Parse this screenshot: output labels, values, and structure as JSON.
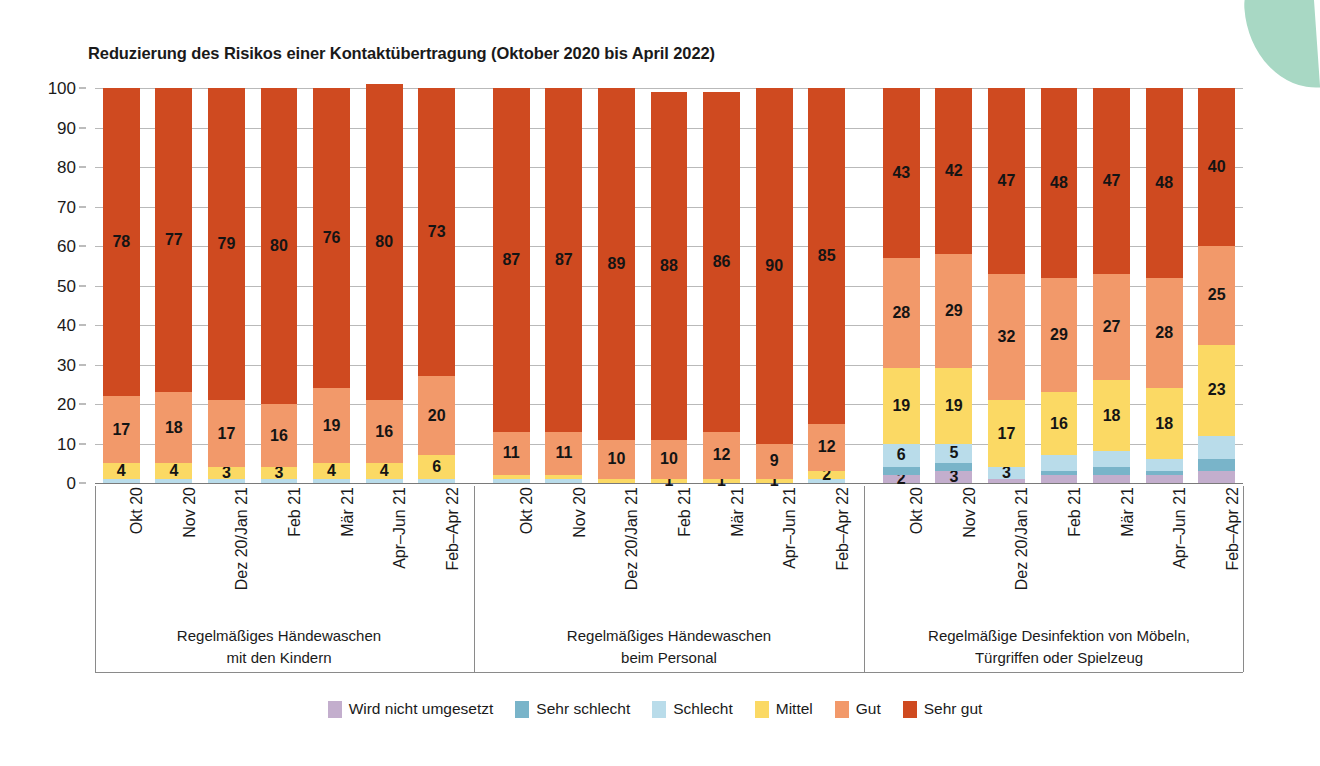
{
  "chart_data": {
    "type": "bar",
    "subtype": "stacked-bar-100-percent",
    "title": "Reduzierung des Risikos einer Kontaktübertragung (Oktober 2020 bis April 2022)",
    "xlabel": "",
    "ylabel": "",
    "ylim": [
      0,
      100
    ],
    "yticks": [
      0,
      10,
      20,
      30,
      40,
      50,
      60,
      70,
      80,
      90,
      100
    ],
    "grid": true,
    "legend_position": "bottom",
    "stack_order_bottom_to_top": [
      "Wird nicht umgesetzt",
      "Sehr schlecht",
      "Schlecht",
      "Mittel",
      "Gut",
      "Sehr gut"
    ],
    "series": [
      {
        "name": "Wird nicht umgesetzt",
        "color": "#c3aecd"
      },
      {
        "name": "Sehr schlecht",
        "color": "#79b4c9"
      },
      {
        "name": "Schlecht",
        "color": "#b9dcea"
      },
      {
        "name": "Mittel",
        "color": "#fbd964"
      },
      {
        "name": "Gut",
        "color": "#f2996a"
      },
      {
        "name": "Sehr gut",
        "color": "#cf4a20"
      }
    ],
    "categories": [
      "Okt 20",
      "Nov 20",
      "Dez 20/Jan 21",
      "Feb 21",
      "Mär 21",
      "Apr–Jun 21",
      "Feb–Apr 22"
    ],
    "groups": [
      {
        "label_line1": "Regelmäßiges Händewaschen",
        "label_line2": "mit den Kindern",
        "bars": [
          {
            "category": "Okt 20",
            "values": {
              "Wird nicht umgesetzt": 0,
              "Sehr schlecht": 0,
              "Schlecht": 1,
              "Mittel": 4,
              "Gut": 17,
              "Sehr gut": 78
            },
            "labels": {
              "Mittel": "4",
              "Gut": "17",
              "Sehr gut": "78"
            }
          },
          {
            "category": "Nov 20",
            "values": {
              "Wird nicht umgesetzt": 0,
              "Sehr schlecht": 0,
              "Schlecht": 1,
              "Mittel": 4,
              "Gut": 18,
              "Sehr gut": 77
            },
            "labels": {
              "Mittel": "4",
              "Gut": "18",
              "Sehr gut": "77"
            }
          },
          {
            "category": "Dez 20/Jan 21",
            "values": {
              "Wird nicht umgesetzt": 0,
              "Sehr schlecht": 0,
              "Schlecht": 1,
              "Mittel": 3,
              "Gut": 17,
              "Sehr gut": 79
            },
            "labels": {
              "Mittel": "3",
              "Gut": "17",
              "Sehr gut": "79"
            }
          },
          {
            "category": "Feb 21",
            "values": {
              "Wird nicht umgesetzt": 0,
              "Sehr schlecht": 0,
              "Schlecht": 1,
              "Mittel": 3,
              "Gut": 16,
              "Sehr gut": 80
            },
            "labels": {
              "Mittel": "3",
              "Gut": "16",
              "Sehr gut": "80"
            }
          },
          {
            "category": "Mär 21",
            "values": {
              "Wird nicht umgesetzt": 0,
              "Sehr schlecht": 0,
              "Schlecht": 1,
              "Mittel": 4,
              "Gut": 19,
              "Sehr gut": 76
            },
            "labels": {
              "Mittel": "4",
              "Gut": "19",
              "Sehr gut": "76"
            }
          },
          {
            "category": "Apr–Jun 21",
            "values": {
              "Wird nicht umgesetzt": 0,
              "Sehr schlecht": 0,
              "Schlecht": 1,
              "Mittel": 4,
              "Gut": 16,
              "Sehr gut": 80
            },
            "labels": {
              "Mittel": "4",
              "Gut": "16",
              "Sehr gut": "80"
            }
          },
          {
            "category": "Feb–Apr 22",
            "values": {
              "Wird nicht umgesetzt": 0,
              "Sehr schlecht": 0,
              "Schlecht": 1,
              "Mittel": 6,
              "Gut": 20,
              "Sehr gut": 73
            },
            "labels": {
              "Mittel": "6",
              "Gut": "20",
              "Sehr gut": "73"
            }
          }
        ]
      },
      {
        "label_line1": "Regelmäßiges Händewaschen",
        "label_line2": "beim Personal",
        "bars": [
          {
            "category": "Okt 20",
            "values": {
              "Wird nicht umgesetzt": 0,
              "Sehr schlecht": 0,
              "Schlecht": 1,
              "Mittel": 1,
              "Gut": 11,
              "Sehr gut": 87
            },
            "labels": {
              "Gut": "11",
              "Sehr gut": "87"
            }
          },
          {
            "category": "Nov 20",
            "values": {
              "Wird nicht umgesetzt": 0,
              "Sehr schlecht": 0,
              "Schlecht": 1,
              "Mittel": 1,
              "Gut": 11,
              "Sehr gut": 87
            },
            "labels": {
              "Gut": "11",
              "Sehr gut": "87"
            }
          },
          {
            "category": "Dez 20/Jan 21",
            "values": {
              "Wird nicht umgesetzt": 0,
              "Sehr schlecht": 0,
              "Schlecht": 0,
              "Mittel": 1,
              "Gut": 10,
              "Sehr gut": 89
            },
            "labels": {
              "Gut": "10",
              "Sehr gut": "89"
            }
          },
          {
            "category": "Feb 21",
            "values": {
              "Wird nicht umgesetzt": 0,
              "Sehr schlecht": 0,
              "Schlecht": 0,
              "Mittel": 1,
              "Gut": 10,
              "Sehr gut": 88
            },
            "labels": {
              "Mittel": "1",
              "Gut": "10",
              "Sehr gut": "88"
            }
          },
          {
            "category": "Mär 21",
            "values": {
              "Wird nicht umgesetzt": 0,
              "Sehr schlecht": 0,
              "Schlecht": 0,
              "Mittel": 1,
              "Gut": 12,
              "Sehr gut": 86
            },
            "labels": {
              "Mittel": "1",
              "Gut": "12",
              "Sehr gut": "86"
            }
          },
          {
            "category": "Apr–Jun 21",
            "values": {
              "Wird nicht umgesetzt": 0,
              "Sehr schlecht": 0,
              "Schlecht": 0,
              "Mittel": 1,
              "Gut": 9,
              "Sehr gut": 90
            },
            "labels": {
              "Mittel": "1",
              "Gut": "9",
              "Sehr gut": "90"
            }
          },
          {
            "category": "Feb–Apr 22",
            "values": {
              "Wird nicht umgesetzt": 0,
              "Sehr schlecht": 0,
              "Schlecht": 1,
              "Mittel": 2,
              "Gut": 12,
              "Sehr gut": 85
            },
            "labels": {
              "Mittel": "2",
              "Gut": "12",
              "Sehr gut": "85"
            }
          }
        ]
      },
      {
        "label_line1": "Regelmäßige Desinfektion von Möbeln,",
        "label_line2": "Türgriffen oder Spielzeug",
        "bars": [
          {
            "category": "Okt 20",
            "values": {
              "Wird nicht umgesetzt": 2,
              "Sehr schlecht": 2,
              "Schlecht": 6,
              "Mittel": 19,
              "Gut": 28,
              "Sehr gut": 43
            },
            "labels": {
              "Wird nicht umgesetzt": "2",
              "Schlecht": "6",
              "Mittel": "19",
              "Gut": "28",
              "Sehr gut": "43"
            }
          },
          {
            "category": "Nov 20",
            "values": {
              "Wird nicht umgesetzt": 3,
              "Sehr schlecht": 2,
              "Schlecht": 5,
              "Mittel": 19,
              "Gut": 29,
              "Sehr gut": 42
            },
            "labels": {
              "Wird nicht umgesetzt": "3",
              "Schlecht": "5",
              "Mittel": "19",
              "Gut": "29",
              "Sehr gut": "42"
            }
          },
          {
            "category": "Dez 20/Jan 21",
            "values": {
              "Wird nicht umgesetzt": 1,
              "Sehr schlecht": 0,
              "Schlecht": 3,
              "Mittel": 17,
              "Gut": 32,
              "Sehr gut": 47
            },
            "labels": {
              "Schlecht": "3",
              "Mittel": "17",
              "Gut": "32",
              "Sehr gut": "47"
            }
          },
          {
            "category": "Feb 21",
            "values": {
              "Wird nicht umgesetzt": 2,
              "Sehr schlecht": 1,
              "Schlecht": 4,
              "Mittel": 16,
              "Gut": 29,
              "Sehr gut": 48
            },
            "labels": {
              "Mittel": "16",
              "Gut": "29",
              "Sehr gut": "48"
            }
          },
          {
            "category": "Mär 21",
            "values": {
              "Wird nicht umgesetzt": 2,
              "Sehr schlecht": 2,
              "Schlecht": 4,
              "Mittel": 18,
              "Gut": 27,
              "Sehr gut": 47
            },
            "labels": {
              "Mittel": "18",
              "Gut": "27",
              "Sehr gut": "47"
            }
          },
          {
            "category": "Apr–Jun 21",
            "values": {
              "Wird nicht umgesetzt": 2,
              "Sehr schlecht": 1,
              "Schlecht": 3,
              "Mittel": 18,
              "Gut": 28,
              "Sehr gut": 48
            },
            "labels": {
              "Mittel": "18",
              "Gut": "28",
              "Sehr gut": "48"
            }
          },
          {
            "category": "Feb–Apr 22",
            "values": {
              "Wird nicht umgesetzt": 3,
              "Sehr schlecht": 3,
              "Schlecht": 6,
              "Mittel": 23,
              "Gut": 25,
              "Sehr gut": 40
            },
            "labels": {
              "Mittel": "23",
              "Gut": "25",
              "Sehr gut": "40"
            }
          }
        ]
      }
    ],
    "legend": [
      {
        "label": "Wird nicht umgesetzt",
        "color": "#c3aecd"
      },
      {
        "label": "Sehr schlecht",
        "color": "#79b4c9"
      },
      {
        "label": "Schlecht",
        "color": "#b9dcea"
      },
      {
        "label": "Mittel",
        "color": "#fbd964"
      },
      {
        "label": "Gut",
        "color": "#f2996a"
      },
      {
        "label": "Sehr gut",
        "color": "#cf4a20"
      }
    ]
  },
  "decoration": {
    "mint_accent_color": "#a8d8c4"
  }
}
